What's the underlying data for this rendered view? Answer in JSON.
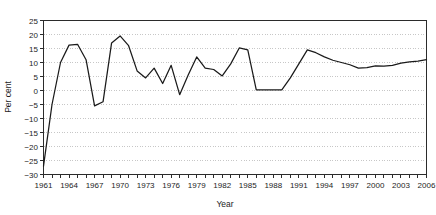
{
  "chart_data": {
    "type": "line",
    "title": "",
    "xlabel": "Year",
    "ylabel": "Per cent",
    "xlim": [
      1961,
      2006
    ],
    "ylim": [
      -30,
      25
    ],
    "ytick_step": 5,
    "xtick_step": 1,
    "xlabel_step": 3,
    "grid": true,
    "legend": "none",
    "line_color": "#1a1a1a",
    "x": [
      1961,
      1962,
      1963,
      1964,
      1965,
      1966,
      1967,
      1968,
      1969,
      1970,
      1971,
      1972,
      1973,
      1974,
      1975,
      1976,
      1977,
      1978,
      1979,
      1980,
      1981,
      1982,
      1983,
      1984,
      1985,
      1986,
      1987,
      1988,
      1989,
      1990,
      1991,
      1992,
      1993,
      1994,
      1995,
      1996,
      1997,
      1998,
      1999,
      2000,
      2001,
      2002,
      2003,
      2004,
      2005,
      2006
    ],
    "values": [
      -27.0,
      -5.0,
      10.0,
      16.2,
      16.5,
      11.0,
      -5.5,
      -4.0,
      17.0,
      19.5,
      16.0,
      7.0,
      4.5,
      8.0,
      2.5,
      9.0,
      -1.5,
      5.5,
      12.0,
      8.0,
      7.5,
      5.2,
      9.5,
      15.2,
      14.5,
      0.2,
      0.2,
      0.2,
      0.2,
      4.5,
      9.5,
      14.5,
      13.5,
      12.0,
      10.8,
      10.0,
      9.2,
      8.0,
      8.2,
      8.8,
      8.7,
      9.0,
      9.8,
      10.2,
      10.5,
      11.0
    ],
    "y_tick_labels": [
      "25",
      "20",
      "15",
      "10",
      "5",
      "0",
      "−5",
      "−10",
      "−15",
      "−20",
      "−25",
      "−30"
    ],
    "y_tick_values": [
      25,
      20,
      15,
      10,
      5,
      0,
      -5,
      -10,
      -15,
      -20,
      -25,
      -30
    ],
    "x_tick_labels": [
      "1961",
      "1964",
      "1967",
      "1970",
      "1973",
      "1976",
      "1979",
      "1982",
      "1985",
      "1988",
      "1991",
      "1994",
      "1997",
      "2000",
      "2003",
      "2006"
    ],
    "x_tick_values": [
      1961,
      1964,
      1967,
      1970,
      1973,
      1976,
      1979,
      1982,
      1985,
      1988,
      1991,
      1994,
      1997,
      2000,
      2003,
      2006
    ]
  }
}
